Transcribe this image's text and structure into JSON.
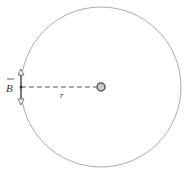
{
  "diagram": {
    "labels": {
      "field": "B",
      "radius": "r"
    },
    "elements": {
      "circle": {
        "cx": 101,
        "cy": 87,
        "r": 80,
        "color": "#aaaaaa"
      },
      "wire": {
        "cx": 101,
        "cy": 87,
        "r": 4,
        "fill": "#cccccc",
        "stroke": "#555555"
      },
      "field_vector": {
        "x": 21,
        "y": 87,
        "direction": "up-and-down",
        "color": "#777777"
      }
    }
  }
}
